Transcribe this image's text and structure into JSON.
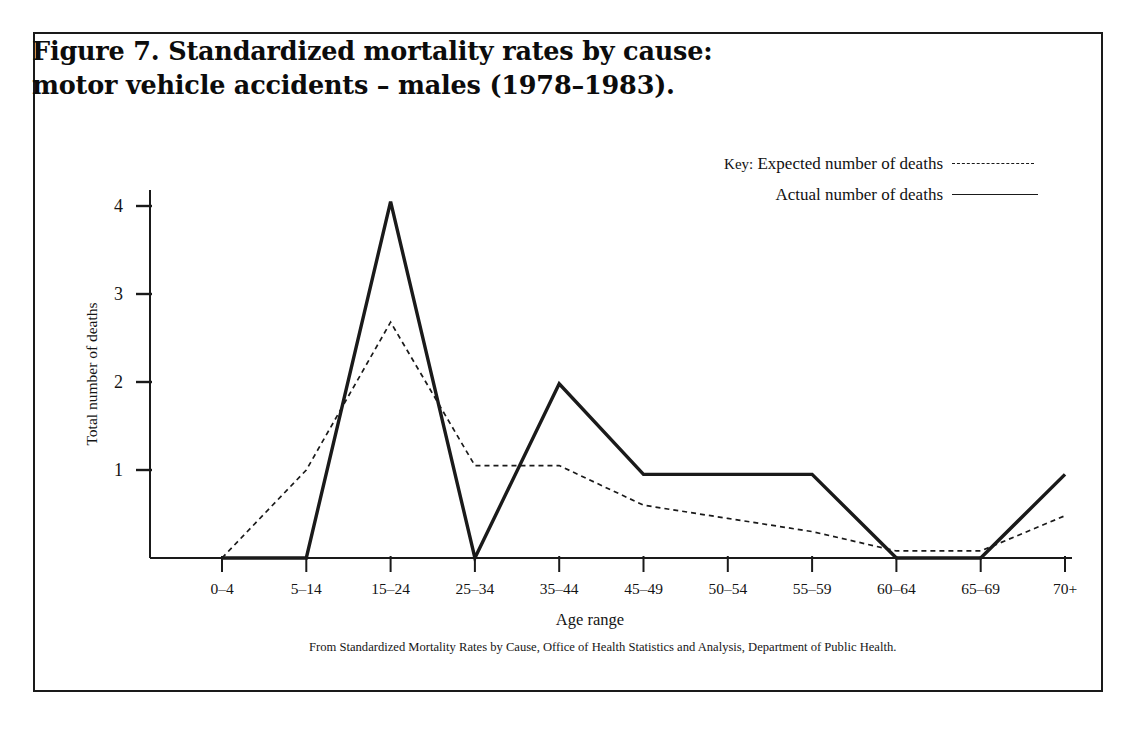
{
  "figure": {
    "title_line1": "Figure 7. Standardized mortality rates by cause:",
    "title_line2": "motor vehicle accidents – males (1978–1983).",
    "source_note_line1": "From Standardized Mortality Rates by Cause, Office of Health Statistics and Analysis, Department of",
    "source_note_line2": "Public Health."
  },
  "legend": {
    "key_word": "Key:",
    "expected_label": "Expected number of deaths",
    "actual_label": "Actual number of deaths",
    "expected_style": "dashed",
    "actual_style": "solid"
  },
  "colors": {
    "ink": "#1a1a1a",
    "frame": "#1a1a1a",
    "background": "#ffffff"
  },
  "chart_data": {
    "type": "line",
    "title": "Figure 7. Standardized mortality rates by cause: motor vehicle accidents – males (1978–1983).",
    "xlabel": "Age range",
    "ylabel": "Total number of deaths",
    "categories": [
      "0–4",
      "5–14",
      "15–24",
      "25–34",
      "35–44",
      "45–49",
      "50–54",
      "55–59",
      "60–64",
      "65–69",
      "70+"
    ],
    "yticks": [
      1,
      2,
      3,
      4
    ],
    "ylim": [
      0,
      4.35
    ],
    "grid": false,
    "legend_position": "top-right",
    "series": [
      {
        "name": "Actual number of deaths",
        "style": "solid",
        "values": [
          0,
          0,
          4.05,
          0,
          1.98,
          0.95,
          0.95,
          0.95,
          0,
          0,
          0.95
        ]
      },
      {
        "name": "Expected number of deaths",
        "style": "dashed",
        "values": [
          0,
          1.0,
          2.68,
          1.05,
          1.05,
          0.6,
          0.45,
          0.3,
          0.08,
          0.08,
          0.48
        ]
      }
    ]
  },
  "axis": {
    "ytick_labels": [
      "1",
      "2",
      "3",
      "4"
    ],
    "axis_title_x": "Age range",
    "axis_title_y": "Total number of deaths"
  }
}
